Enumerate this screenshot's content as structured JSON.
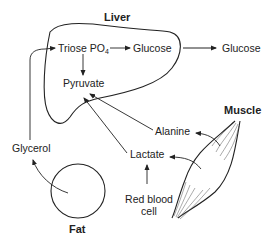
{
  "organs": {
    "liver": "Liver",
    "muscle": "Muscle",
    "fat": "Fat"
  },
  "metabolites": {
    "triose_po4": "Triose PO",
    "triose_sub": "4",
    "glucose_liver": "Glucose",
    "glucose_blood": "Glucose",
    "pyruvate": "Pyruvate",
    "glycerol": "Glycerol",
    "alanine": "Alanine",
    "lactate": "Lactate",
    "red_blood_cell_line1": "Red blood",
    "red_blood_cell_line2": "cell"
  },
  "colors": {
    "line": "#222222",
    "text": "#222222",
    "background": "#ffffff"
  }
}
